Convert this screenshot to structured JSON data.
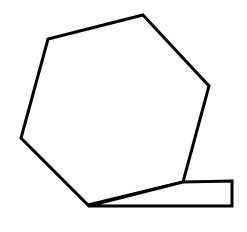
{
  "figure": {
    "canvas": {
      "width": 247,
      "height": 232,
      "background_color": "#ffffff"
    },
    "style": {
      "stroke_color": "#000000",
      "fill_color": "#ffffff",
      "stroke_width": 3
    },
    "shapes": [
      {
        "id": "hexagon",
        "name": "irregular-hexagon",
        "kind": "polygon",
        "sides": 6,
        "fill": "#ffffff",
        "stroke": "#000000",
        "points": "143,15 209,86 183,182 88,205 21,138 48,39",
        "vertices": [
          {
            "label": "top",
            "x": 143,
            "y": 15
          },
          {
            "label": "upper-right",
            "x": 209,
            "y": 86
          },
          {
            "label": "lower-right",
            "x": 183,
            "y": 182
          },
          {
            "label": "bottom",
            "x": 88,
            "y": 205
          },
          {
            "label": "lower-left",
            "x": 21,
            "y": 138
          },
          {
            "label": "upper-left",
            "x": 48,
            "y": 39
          }
        ]
      },
      {
        "id": "wedge",
        "name": "wedge-quadrilateral",
        "kind": "polygon",
        "sides": 4,
        "fill": "#ffffff",
        "stroke": "#000000",
        "points": "88,206 183,182 232,181 232,206",
        "vertices": [
          {
            "label": "left-tip",
            "x": 88,
            "y": 206
          },
          {
            "label": "top-left-bend",
            "x": 183,
            "y": 182
          },
          {
            "label": "top-right",
            "x": 232,
            "y": 181
          },
          {
            "label": "bottom-right",
            "x": 232,
            "y": 206
          }
        ]
      }
    ]
  }
}
